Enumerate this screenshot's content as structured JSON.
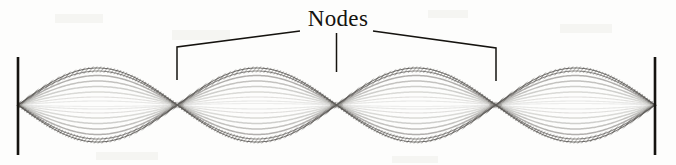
{
  "figure": {
    "label_nodes": "Nodes",
    "background_color": "#fdfdfc",
    "ink_color": "#15130f",
    "strand_color": "#7e7c78",
    "width": 676,
    "height": 165
  },
  "chart_data": {
    "type": "line",
    "title": "Nodes",
    "xlabel": "",
    "ylabel": "",
    "subtitle": "",
    "grid": false,
    "legend_position": "none",
    "harmonic": 4,
    "loops": 4,
    "xlim": [
      18,
      655
    ],
    "ylim": [
      68,
      143
    ],
    "axis_center_y": 105,
    "max_amplitude": 37,
    "wavelength_px": 318.5,
    "node_positions_x": [
      18,
      177.25,
      336.5,
      495.75,
      655
    ],
    "interior_node_positions_x": [
      177.25,
      336.5,
      495.75
    ],
    "antinode_positions_x": [
      97.6,
      256.9,
      416.1,
      575.4
    ],
    "strand_amplitudes": [
      37,
      34,
      29.5,
      24,
      18.5,
      13,
      8,
      4,
      1.5
    ],
    "strand_opacities": [
      0.95,
      0.78,
      0.6,
      0.46,
      0.36,
      0.28,
      0.22,
      0.17,
      0.13
    ],
    "endpoints": {
      "left_bar_x": 18,
      "right_bar_x": 655,
      "bar_top_y": 57,
      "bar_bottom_y": 155,
      "bar_width": 2.6,
      "bar_color": "#15130f"
    },
    "annotations": [
      {
        "text": "Nodes",
        "text_x": 336,
        "text_y": 20,
        "leaders": [
          {
            "name": "left-leader",
            "points": [
              [
                300,
                31
              ],
              [
                177,
                47
              ],
              [
                177,
                80
              ]
            ],
            "target_node_x": 177.25
          },
          {
            "name": "center-leader",
            "points": [
              [
                336.5,
                33
              ],
              [
                336.5,
                72
              ]
            ],
            "target_node_x": 336.5
          },
          {
            "name": "right-leader",
            "points": [
              [
                373,
                31
              ],
              [
                496,
                48
              ],
              [
                496,
                81
              ]
            ],
            "target_node_x": 495.75
          }
        ]
      }
    ]
  }
}
